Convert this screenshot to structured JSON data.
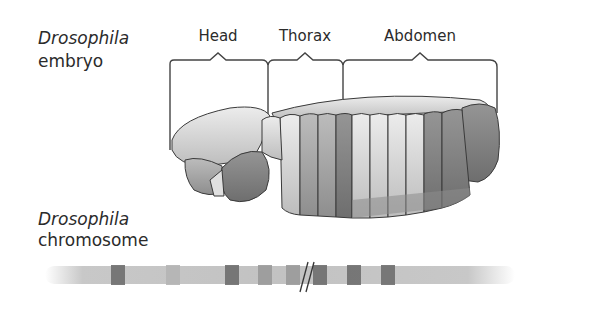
{
  "embryo_label": {
    "line1": "Drosophila",
    "line2": "embryo"
  },
  "chromosome_label": {
    "line1": "Drosophila",
    "line2": "chromosome"
  },
  "regions": [
    {
      "name": "Head",
      "center_x": 218
    },
    {
      "name": "Thorax",
      "center_x": 305
    },
    {
      "name": "Abdomen",
      "center_x": 420
    }
  ],
  "colors": {
    "outline": "#3a3a3a",
    "bracket": "#444444",
    "light_segment": "#d9d9d9",
    "mid_segment": "#a9a9a9",
    "dark_segment": "#7e7e7e",
    "chromosome_base": "#c8c8c8",
    "band_dark": "#6e6e6e",
    "band_mid": "#9a9a9a"
  },
  "chromosome": {
    "bands": [
      {
        "x": 111,
        "w": 14,
        "shade": "dark"
      },
      {
        "x": 166,
        "w": 14,
        "shade": "light"
      },
      {
        "x": 225,
        "w": 14,
        "shade": "dark"
      },
      {
        "x": 258,
        "w": 14,
        "shade": "mid"
      },
      {
        "x": 286,
        "w": 14,
        "shade": "mid"
      },
      {
        "x": 313,
        "w": 14,
        "shade": "dark"
      },
      {
        "x": 347,
        "w": 14,
        "shade": "dark"
      },
      {
        "x": 381,
        "w": 14,
        "shade": "dark"
      }
    ],
    "break_symbol": "//"
  }
}
